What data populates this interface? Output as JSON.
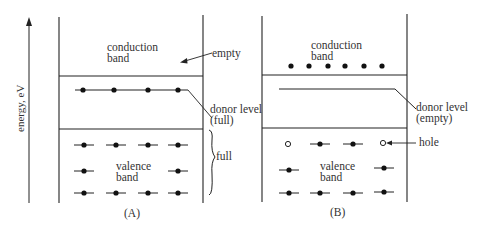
{
  "axis": {
    "label": "energy, eV"
  },
  "panel_a": {
    "caption": "(A)",
    "conduction_band": [
      "conduction",
      "band"
    ],
    "empty_label": "empty",
    "donor_level": [
      "donor level",
      "(full)"
    ],
    "valence_band": [
      "valence",
      "band"
    ],
    "full_label": "full"
  },
  "panel_b": {
    "caption": "(B)",
    "conduction_band": [
      "conduction",
      "band"
    ],
    "donor_level": [
      "donor level",
      "(empty)"
    ],
    "valence_band": [
      "valence",
      "band"
    ],
    "hole_label": "hole"
  },
  "colors": {
    "line": "#222222",
    "background": "#ffffff"
  }
}
